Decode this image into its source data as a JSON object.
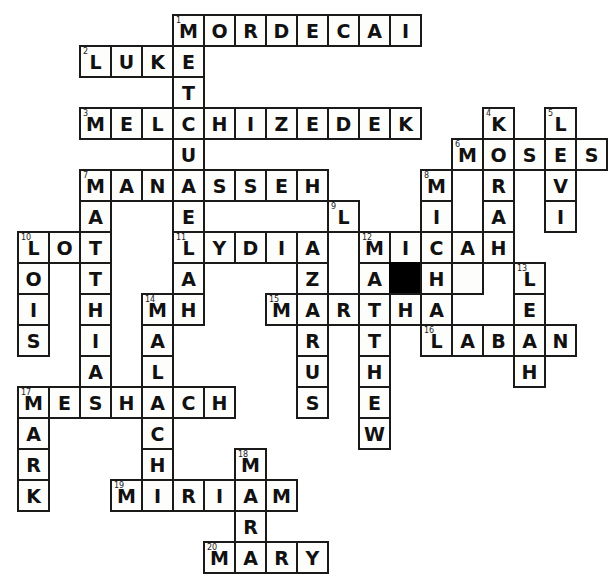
{
  "puzzle": {
    "title": "Bible Names Crossword",
    "grid": {
      "origin_x": 17,
      "origin_y": 14,
      "cell": 31,
      "cols": 19,
      "rows": 18
    },
    "style": {
      "cell_fill": "#fdfdfb",
      "block_fill": "#000000",
      "line_color": "#1a1a1a",
      "letter_color": "#111111"
    },
    "cells": [
      {
        "r": 0,
        "c": 5,
        "letter": "M",
        "num": "1"
      },
      {
        "r": 0,
        "c": 6,
        "letter": "O"
      },
      {
        "r": 0,
        "c": 7,
        "letter": "R"
      },
      {
        "r": 0,
        "c": 8,
        "letter": "D"
      },
      {
        "r": 0,
        "c": 9,
        "letter": "E"
      },
      {
        "r": 0,
        "c": 10,
        "letter": "C"
      },
      {
        "r": 0,
        "c": 11,
        "letter": "A"
      },
      {
        "r": 0,
        "c": 12,
        "letter": "I"
      },
      {
        "r": 1,
        "c": 2,
        "letter": "L",
        "num": "2"
      },
      {
        "r": 1,
        "c": 3,
        "letter": "U"
      },
      {
        "r": 1,
        "c": 4,
        "letter": "K"
      },
      {
        "r": 1,
        "c": 5,
        "letter": "E"
      },
      {
        "r": 2,
        "c": 5,
        "letter": "T"
      },
      {
        "r": 3,
        "c": 2,
        "letter": "M",
        "num": "3"
      },
      {
        "r": 3,
        "c": 3,
        "letter": "E"
      },
      {
        "r": 3,
        "c": 4,
        "letter": "L"
      },
      {
        "r": 3,
        "c": 5,
        "letter": "C"
      },
      {
        "r": 3,
        "c": 6,
        "letter": "H"
      },
      {
        "r": 3,
        "c": 7,
        "letter": "I"
      },
      {
        "r": 3,
        "c": 8,
        "letter": "Z"
      },
      {
        "r": 3,
        "c": 9,
        "letter": "E"
      },
      {
        "r": 3,
        "c": 10,
        "letter": "D"
      },
      {
        "r": 3,
        "c": 11,
        "letter": "E"
      },
      {
        "r": 3,
        "c": 12,
        "letter": "K"
      },
      {
        "r": 3,
        "c": 15,
        "letter": "K",
        "num": "4"
      },
      {
        "r": 3,
        "c": 17,
        "letter": "L",
        "num": "5"
      },
      {
        "r": 4,
        "c": 5,
        "letter": "U"
      },
      {
        "r": 4,
        "c": 14,
        "letter": "M",
        "num": "6"
      },
      {
        "r": 4,
        "c": 15,
        "letter": "O"
      },
      {
        "r": 4,
        "c": 16,
        "letter": "S"
      },
      {
        "r": 4,
        "c": 17,
        "letter": "E"
      },
      {
        "r": 4,
        "c": 18,
        "letter": "S"
      },
      {
        "r": 5,
        "c": 2,
        "letter": "M",
        "num": "7"
      },
      {
        "r": 5,
        "c": 3,
        "letter": "A"
      },
      {
        "r": 5,
        "c": 4,
        "letter": "N"
      },
      {
        "r": 5,
        "c": 5,
        "letter": "A"
      },
      {
        "r": 5,
        "c": 6,
        "letter": "S"
      },
      {
        "r": 5,
        "c": 7,
        "letter": "S"
      },
      {
        "r": 5,
        "c": 8,
        "letter": "E"
      },
      {
        "r": 5,
        "c": 9,
        "letter": "H"
      },
      {
        "r": 5,
        "c": 13,
        "letter": "M",
        "num": "8"
      },
      {
        "r": 5,
        "c": 15,
        "letter": "R"
      },
      {
        "r": 5,
        "c": 17,
        "letter": "V"
      },
      {
        "r": 6,
        "c": 2,
        "letter": "A"
      },
      {
        "r": 6,
        "c": 5,
        "letter": "E"
      },
      {
        "r": 6,
        "c": 10,
        "letter": "L",
        "num": "9"
      },
      {
        "r": 6,
        "c": 13,
        "letter": "I"
      },
      {
        "r": 6,
        "c": 15,
        "letter": "A"
      },
      {
        "r": 6,
        "c": 17,
        "letter": "I"
      },
      {
        "r": 7,
        "c": 0,
        "letter": "L",
        "num": "10"
      },
      {
        "r": 7,
        "c": 1,
        "letter": "O"
      },
      {
        "r": 7,
        "c": 2,
        "letter": "T"
      },
      {
        "r": 7,
        "c": 5,
        "letter": "L",
        "num": "11"
      },
      {
        "r": 7,
        "c": 6,
        "letter": "Y"
      },
      {
        "r": 7,
        "c": 7,
        "letter": "D"
      },
      {
        "r": 7,
        "c": 8,
        "letter": "I"
      },
      {
        "r": 7,
        "c": 9,
        "letter": "A"
      },
      {
        "r": 7,
        "c": 11,
        "letter": "M",
        "num": "12"
      },
      {
        "r": 7,
        "c": 12,
        "letter": "I"
      },
      {
        "r": 7,
        "c": 13,
        "letter": "C"
      },
      {
        "r": 7,
        "c": 14,
        "letter": "A"
      },
      {
        "r": 7,
        "c": 15,
        "letter": "H"
      },
      {
        "r": 8,
        "c": 0,
        "letter": "O"
      },
      {
        "r": 8,
        "c": 2,
        "letter": "T"
      },
      {
        "r": 8,
        "c": 5,
        "letter": "A"
      },
      {
        "r": 8,
        "c": 9,
        "letter": "Z"
      },
      {
        "r": 8,
        "c": 11,
        "letter": "A"
      },
      {
        "r": 8,
        "c": 12,
        "letter": "",
        "black": true
      },
      {
        "r": 8,
        "c": 13,
        "letter": "H"
      },
      {
        "r": 8,
        "c": 14,
        "letter": ""
      },
      {
        "r": 8,
        "c": 16,
        "letter": "L",
        "num": "13"
      },
      {
        "r": 9,
        "c": 0,
        "letter": "I"
      },
      {
        "r": 9,
        "c": 2,
        "letter": "H"
      },
      {
        "r": 9,
        "c": 4,
        "letter": "M",
        "num": "14"
      },
      {
        "r": 9,
        "c": 5,
        "letter": "H"
      },
      {
        "r": 9,
        "c": 8,
        "letter": "M",
        "num": "15"
      },
      {
        "r": 9,
        "c": 9,
        "letter": "A"
      },
      {
        "r": 9,
        "c": 10,
        "letter": "R"
      },
      {
        "r": 9,
        "c": 11,
        "letter": "T"
      },
      {
        "r": 9,
        "c": 12,
        "letter": "H"
      },
      {
        "r": 9,
        "c": 13,
        "letter": "A"
      },
      {
        "r": 9,
        "c": 16,
        "letter": "E"
      },
      {
        "r": 10,
        "c": 0,
        "letter": "S"
      },
      {
        "r": 10,
        "c": 2,
        "letter": "I"
      },
      {
        "r": 10,
        "c": 4,
        "letter": "A"
      },
      {
        "r": 10,
        "c": 9,
        "letter": "R"
      },
      {
        "r": 10,
        "c": 11,
        "letter": "T"
      },
      {
        "r": 10,
        "c": 13,
        "letter": "L",
        "num": "16"
      },
      {
        "r": 10,
        "c": 14,
        "letter": "A"
      },
      {
        "r": 10,
        "c": 15,
        "letter": "B"
      },
      {
        "r": 10,
        "c": 16,
        "letter": "A"
      },
      {
        "r": 10,
        "c": 17,
        "letter": "N"
      },
      {
        "r": 11,
        "c": 2,
        "letter": "A"
      },
      {
        "r": 11,
        "c": 4,
        "letter": "L"
      },
      {
        "r": 11,
        "c": 9,
        "letter": "U"
      },
      {
        "r": 11,
        "c": 11,
        "letter": "H"
      },
      {
        "r": 11,
        "c": 16,
        "letter": "H"
      },
      {
        "r": 12,
        "c": 0,
        "letter": "M",
        "num": "17"
      },
      {
        "r": 12,
        "c": 1,
        "letter": "E"
      },
      {
        "r": 12,
        "c": 2,
        "letter": "S"
      },
      {
        "r": 12,
        "c": 3,
        "letter": "H"
      },
      {
        "r": 12,
        "c": 4,
        "letter": "A"
      },
      {
        "r": 12,
        "c": 5,
        "letter": "C"
      },
      {
        "r": 12,
        "c": 6,
        "letter": "H"
      },
      {
        "r": 12,
        "c": 9,
        "letter": "S"
      },
      {
        "r": 12,
        "c": 11,
        "letter": "E"
      },
      {
        "r": 13,
        "c": 0,
        "letter": "A"
      },
      {
        "r": 13,
        "c": 4,
        "letter": "C"
      },
      {
        "r": 13,
        "c": 11,
        "letter": "W"
      },
      {
        "r": 14,
        "c": 0,
        "letter": "R"
      },
      {
        "r": 14,
        "c": 4,
        "letter": "H"
      },
      {
        "r": 14,
        "c": 7,
        "letter": "M",
        "num": "18"
      },
      {
        "r": 15,
        "c": 0,
        "letter": "K"
      },
      {
        "r": 15,
        "c": 3,
        "letter": "M",
        "num": "19"
      },
      {
        "r": 15,
        "c": 4,
        "letter": "I"
      },
      {
        "r": 15,
        "c": 5,
        "letter": "R"
      },
      {
        "r": 15,
        "c": 6,
        "letter": "I"
      },
      {
        "r": 15,
        "c": 7,
        "letter": "A"
      },
      {
        "r": 15,
        "c": 8,
        "letter": "M"
      },
      {
        "r": 16,
        "c": 7,
        "letter": "R"
      },
      {
        "r": 17,
        "c": 6,
        "letter": "M",
        "num": "20"
      },
      {
        "r": 17,
        "c": 7,
        "letter": "A"
      },
      {
        "r": 17,
        "c": 8,
        "letter": "R"
      },
      {
        "r": 17,
        "c": 9,
        "letter": "Y"
      }
    ],
    "answers": {
      "across": [
        {
          "num": "1",
          "word": "MORDECAI"
        },
        {
          "num": "2",
          "word": "LUKE"
        },
        {
          "num": "3",
          "word": "MELCHIZEDEK"
        },
        {
          "num": "6",
          "word": "MOSES"
        },
        {
          "num": "7",
          "word": "MANASSEH"
        },
        {
          "num": "10",
          "word": "LOT"
        },
        {
          "num": "11",
          "word": "LYDIA"
        },
        {
          "num": "12",
          "word": "MICAH"
        },
        {
          "num": "15",
          "word": "MARTHA"
        },
        {
          "num": "16",
          "word": "LABAN"
        },
        {
          "num": "17",
          "word": "MESHACH"
        },
        {
          "num": "19",
          "word": "MIRIAM"
        },
        {
          "num": "20",
          "word": "MARY"
        }
      ],
      "down": [
        {
          "num": "1",
          "word": "METHUSELAH"
        },
        {
          "num": "4",
          "word": "KORAH"
        },
        {
          "num": "5",
          "word": "LEVI"
        },
        {
          "num": "7",
          "word": "MATTHIAS"
        },
        {
          "num": "8",
          "word": "MIC"
        },
        {
          "num": "9",
          "word": "LAZARUS"
        },
        {
          "num": "10",
          "word": "LOIS"
        },
        {
          "num": "11",
          "word": "LEAH"
        },
        {
          "num": "12",
          "word": "MATTHEW"
        },
        {
          "num": "13",
          "word": "LEAH"
        },
        {
          "num": "14",
          "word": "MALACHI"
        },
        {
          "num": "17",
          "word": "MARK"
        },
        {
          "num": "18",
          "word": "MARY"
        }
      ]
    }
  }
}
